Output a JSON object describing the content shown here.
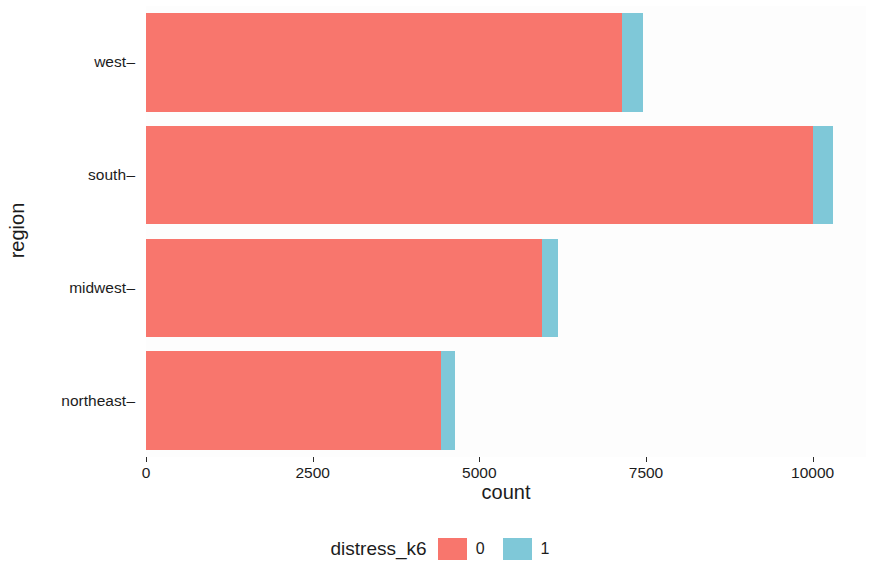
{
  "chart_data": {
    "type": "bar",
    "orientation": "horizontal",
    "stacked": true,
    "title": "",
    "xlabel": "count",
    "ylabel": "region",
    "categories": [
      "west",
      "south",
      "midwest",
      "northeast"
    ],
    "series": [
      {
        "name": "0",
        "color": "#F8766D",
        "values": [
          7140,
          10000,
          5940,
          4420
        ]
      },
      {
        "name": "1",
        "color": "#7FC8D8",
        "values": [
          310,
          310,
          240,
          210
        ]
      }
    ],
    "totals": [
      7450,
      10310,
      6180,
      4630
    ],
    "xlim": [
      0,
      10800
    ],
    "xticks": [
      0,
      2500,
      5000,
      7500,
      10000
    ],
    "xtick_labels": [
      "0",
      "2500",
      "5000",
      "7500",
      "10000"
    ],
    "grid": false,
    "legend": {
      "title": "distress_k6",
      "position": "bottom",
      "entries": [
        {
          "label": "0",
          "color": "#F8766D"
        },
        {
          "label": "1",
          "color": "#7FC8D8"
        }
      ]
    },
    "panel_background": "#fdfdfd",
    "plot_background": "#ffffff"
  }
}
